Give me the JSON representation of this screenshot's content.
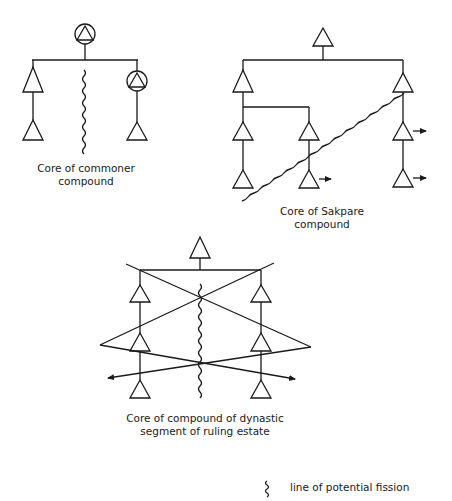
{
  "diagrams": [
    {
      "id": "commoner",
      "caption": [
        "Core of commoner",
        "compound"
      ]
    },
    {
      "id": "sakpare",
      "caption": [
        "Core of Sakpare",
        "compound"
      ]
    },
    {
      "id": "dynastic",
      "caption": [
        "Core of compound of dynastic",
        "segment of ruling estate"
      ]
    }
  ],
  "legend": {
    "symbol": "wavy-line",
    "label": "line of potential fission"
  },
  "colors": {
    "ink": "#1a1a1a",
    "paper": "#ffffff"
  }
}
